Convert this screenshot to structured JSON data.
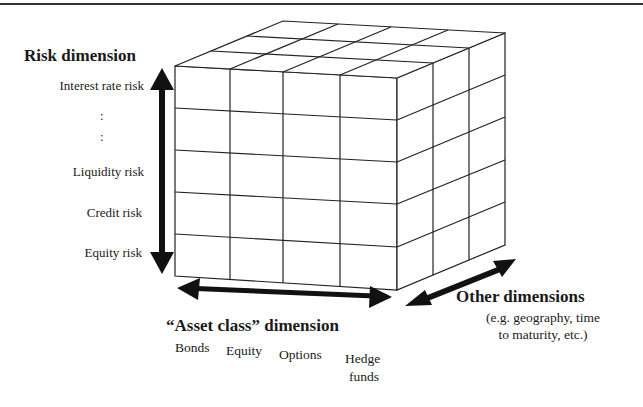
{
  "diagram": {
    "risk_dimension": {
      "title": "Risk dimension",
      "items": [
        "Interest rate risk",
        ":",
        ":",
        "Liquidity risk",
        "Credit risk",
        "Equity risk"
      ]
    },
    "asset_dimension": {
      "title": "“Asset class” dimension",
      "items": [
        "Bonds",
        "Equity",
        "Options",
        "Hedge",
        "funds"
      ]
    },
    "other_dimensions": {
      "title": "Other dimensions",
      "subtitle_line1": "(e.g. geography, time",
      "subtitle_line2": "to maturity, etc.)"
    },
    "cube": {
      "front_columns": 4,
      "front_rows": 5,
      "depth_segments": 3,
      "line_color": "#222222",
      "arrow_color": "#111111"
    }
  }
}
